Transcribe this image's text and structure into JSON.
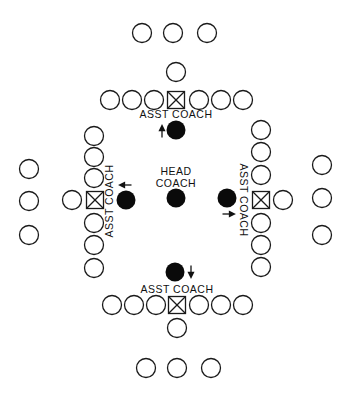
{
  "diagram": {
    "title": "",
    "labels": {
      "head_coach_line1": "HEAD",
      "head_coach_line2": "COACH",
      "asst_coach_top": "ASST  COACH",
      "asst_coach_bottom": "ASST  COACH",
      "asst_coach_left": "ASST  COACH",
      "asst_coach_right": "ASST  COACH"
    },
    "groups": [
      {
        "name": "top",
        "players_in_line": 6,
        "center_marker": "x-box",
        "extra_players_beyond_center": 1,
        "outer_players": 3,
        "coach_arrow": "up"
      },
      {
        "name": "bottom",
        "players_in_line": 6,
        "center_marker": "x-box",
        "extra_players_beyond_center": 1,
        "outer_players": 3,
        "coach_arrow": "down"
      },
      {
        "name": "left",
        "players_in_line": 6,
        "center_marker": "x-box",
        "extra_players_beyond_center": 1,
        "outer_players": 3,
        "coach_arrow": "left"
      },
      {
        "name": "right",
        "players_in_line": 6,
        "center_marker": "x-box",
        "extra_players_beyond_center": 1,
        "outer_players": 3,
        "coach_arrow": "right"
      }
    ],
    "legend": {
      "open_circle": "player",
      "x_box": "center",
      "filled_circle": "coach"
    }
  }
}
